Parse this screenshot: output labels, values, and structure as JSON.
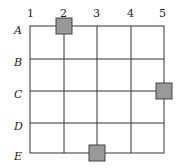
{
  "grid": {
    "columns": [
      "1",
      "2",
      "3",
      "4",
      "5"
    ],
    "rows": [
      "A",
      "B",
      "C",
      "D",
      "E"
    ],
    "line_color": "#333333",
    "square_fill": "#999999",
    "square_stroke": "#444444"
  },
  "squares": [
    {
      "row": "A",
      "col": "2"
    },
    {
      "row": "C",
      "col": "5"
    },
    {
      "row": "E",
      "col": "3"
    }
  ]
}
